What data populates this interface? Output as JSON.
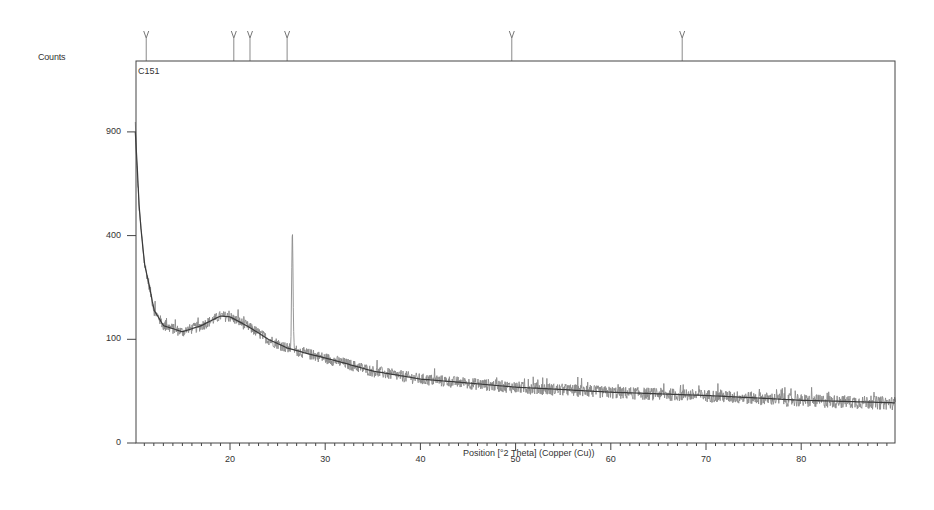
{
  "chart_data": {
    "type": "line",
    "title": "",
    "panel_label": "C151",
    "xlabel": "Position [°2 Theta] (Copper (Cu))",
    "ylabel": "Counts",
    "y_scale": "sqrt",
    "xlim": [
      10,
      90
    ],
    "ylim": [
      0,
      1150
    ],
    "x_ticks": [
      20,
      30,
      40,
      50,
      60,
      70,
      80
    ],
    "x_tick_labels": [
      "20",
      "30",
      "40",
      "50",
      "60",
      "70",
      "80"
    ],
    "y_ticks": [
      0,
      100,
      400,
      900
    ],
    "y_tick_labels": [
      "0",
      "100",
      "400",
      "900"
    ],
    "grid": false,
    "legend": null,
    "peak_markers_2theta": [
      11.2,
      20.4,
      22.1,
      26.0,
      49.6,
      67.5
    ],
    "series": [
      {
        "name": "Observed (C151)",
        "color": "#8a8a8a",
        "x": [
          10.05,
          10.2,
          10.4,
          10.6,
          11.0,
          11.5,
          12.0,
          13.0,
          14.0,
          15.0,
          16.0,
          17.0,
          18.0,
          19.0,
          19.6,
          20.5,
          21.5,
          22.5,
          23.5,
          24.5,
          25.5,
          26.0,
          26.3,
          26.6,
          27.0,
          28.0,
          30.0,
          32.0,
          35.0,
          38.0,
          40.0,
          45.0,
          50.0,
          55.0,
          60.0,
          65.0,
          70.0,
          75.0,
          80.0,
          85.0,
          89.9
        ],
        "y": [
          950,
          720,
          560,
          420,
          300,
          210,
          160,
          128,
          118,
          116,
          120,
          130,
          142,
          155,
          160,
          150,
          135,
          118,
          102,
          92,
          85,
          95,
          400,
          110,
          82,
          76,
          68,
          58,
          48,
          40,
          38,
          33,
          29,
          26,
          24,
          22,
          21,
          19,
          17,
          16,
          15
        ]
      },
      {
        "name": "Background fit",
        "color": "#444444",
        "x": [
          10.05,
          10.5,
          11.0,
          12.0,
          13.0,
          15.0,
          17.0,
          19.0,
          20.0,
          22.0,
          24.0,
          26.0,
          28.0,
          30.0,
          35.0,
          40.0,
          50.0,
          60.0,
          70.0,
          80.0,
          89.9
        ],
        "y": [
          900,
          480,
          300,
          165,
          128,
          115,
          128,
          150,
          148,
          125,
          100,
          84,
          75,
          67,
          48,
          38,
          29,
          24,
          21,
          17,
          15
        ]
      }
    ],
    "colors": {
      "axis": "#444444",
      "observed": "#8a8a8a",
      "fit": "#3a3a3a",
      "marker": "#8a8a8a"
    }
  }
}
